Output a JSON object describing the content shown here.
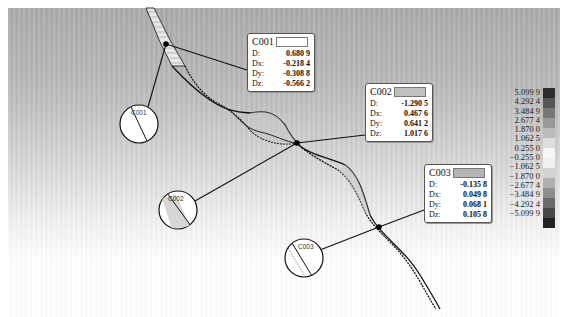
{
  "figure": {
    "type": "glacier/river bank deformation comparison map",
    "background_colors": [
      "#a9a9a9",
      "#ffffff"
    ],
    "line_color": "#111111"
  },
  "callouts": [
    {
      "id": "C001",
      "swatch_color": "#ffffff",
      "rows": [
        {
          "key": "D:",
          "value": "0.680 9"
        },
        {
          "key": "Dx:",
          "value": "-0.218 4"
        },
        {
          "key": "Dy:",
          "value": "-0.308 8"
        },
        {
          "key": "Dz:",
          "value": "-0.566 2"
        }
      ],
      "anchor": [
        166,
        44
      ],
      "box": [
        247,
        33
      ],
      "detail_circle": {
        "label": "C001",
        "center": [
          139,
          124
        ],
        "r": 19
      }
    },
    {
      "id": "C002",
      "swatch_color": "#bfbfbf",
      "rows": [
        {
          "key": "D:",
          "value": "-1.290 5"
        },
        {
          "key": "Dx:",
          "value": "0.467 6"
        },
        {
          "key": "Dy:",
          "value": "0.641 2"
        },
        {
          "key": "Dz:",
          "value": "1.017 6"
        }
      ],
      "anchor": [
        297,
        143
      ],
      "box": [
        365,
        83
      ],
      "detail_circle": {
        "label": "C002",
        "center": [
          178,
          210
        ],
        "r": 19
      }
    },
    {
      "id": "C003",
      "swatch_color": "#b5b5b5",
      "rows": [
        {
          "key": "D:",
          "value": "-0.135 8"
        },
        {
          "key": "Dx:",
          "value": "0.049 8"
        },
        {
          "key": "Dy:",
          "value": "0.068 1"
        },
        {
          "key": "Dz:",
          "value": "0.105 8"
        }
      ],
      "anchor": [
        379,
        227
      ],
      "box": [
        424,
        164
      ],
      "detail_circle": {
        "label": "C003",
        "center": [
          304,
          258
        ],
        "r": 19
      }
    }
  ],
  "legend": {
    "labels": [
      "5.099 9",
      "4.292 4",
      "3.484 9",
      "2.677 4",
      "1.870 0",
      "1.062 5",
      "0.255 0",
      "−0.255 0",
      "−1.062 5",
      "−1.870 0",
      "−2.677 4",
      "−3.484 9",
      "−4.292 4",
      "−5.099 9"
    ],
    "colors": [
      "#2e2e2e",
      "#555555",
      "#777777",
      "#999999",
      "#bbbbbb",
      "#dddddd",
      "#f6f6f6",
      "#f0f0f0",
      "#d2d2d2",
      "#b0b0b0",
      "#8e8e8e",
      "#6a6a6a",
      "#474747",
      "#222222"
    ]
  }
}
